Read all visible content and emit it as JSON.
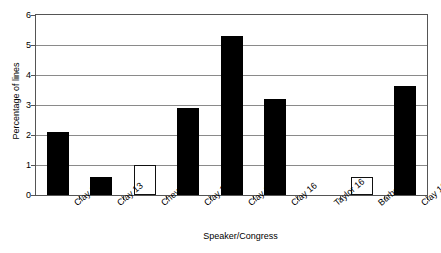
{
  "chart_data": {
    "type": "bar",
    "title": "",
    "xlabel": "Speaker/Congress",
    "ylabel": "Percentage of lines",
    "categories": [
      "Clay 12",
      "Clay 13",
      "Cheves 13",
      "Clay 14",
      "Clay 15",
      "Clay 16",
      "Taylor 16",
      "Barbour 17",
      "Clay 18"
    ],
    "values": [
      2.1,
      0.6,
      1.0,
      2.9,
      5.3,
      3.2,
      0.0,
      0.6,
      3.65
    ],
    "bar_styles": [
      "filled",
      "filled",
      "open",
      "filled",
      "filled",
      "filled",
      "none",
      "open",
      "filled"
    ],
    "ylim": [
      0,
      6
    ],
    "yticks": [
      0,
      1,
      2,
      3,
      4,
      5,
      6
    ],
    "ytick_labels": [
      "0",
      "1",
      "2",
      "3",
      "4",
      "5",
      "6"
    ],
    "grid": true,
    "legend": "none",
    "colors": {
      "filled_bar": "#000000",
      "open_bar_fill": "#ffffff",
      "open_bar_border": "#111111",
      "gridline": "#8a8a8a",
      "axis": "#555555",
      "background": "#ffffff",
      "text": "#000000"
    }
  }
}
